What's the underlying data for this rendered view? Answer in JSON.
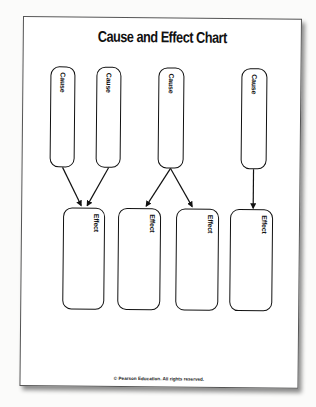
{
  "title": "Cause and Effect Chart",
  "causes": [
    {
      "label": "Cause"
    },
    {
      "label": "Cause"
    },
    {
      "label": "Cause"
    },
    {
      "label": "Cause"
    }
  ],
  "effects": [
    {
      "label": "Effect"
    },
    {
      "label": "Effect"
    },
    {
      "label": "Effect"
    },
    {
      "label": "Effect"
    }
  ],
  "connections": [
    {
      "from": "cause-1",
      "to": "effect-1"
    },
    {
      "from": "cause-2",
      "to": "effect-1"
    },
    {
      "from": "cause-3",
      "to": "effect-2"
    },
    {
      "from": "cause-3",
      "to": "effect-3"
    },
    {
      "from": "cause-4",
      "to": "effect-4"
    }
  ],
  "footer": "© Pearson Education. All rights reserved."
}
